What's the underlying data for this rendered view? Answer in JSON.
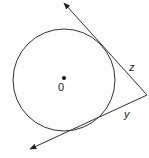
{
  "diagram": {
    "type": "circle-with-tangents",
    "center_label": "0",
    "tangent_labels": {
      "upper": "z",
      "lower": "y"
    },
    "colors": {
      "stroke": "#333333",
      "background": "#ffffff"
    }
  }
}
